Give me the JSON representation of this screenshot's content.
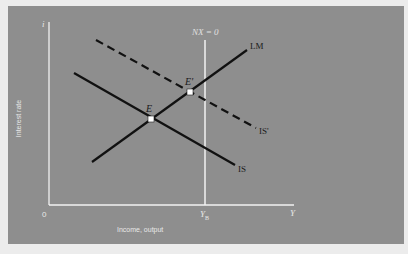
{
  "diagram": {
    "type": "IS-LM-BP economics diagram",
    "axes": {
      "y_axis_symbol": "i",
      "y_axis_label": "Interest rate",
      "x_axis_symbol": "Y",
      "x_axis_label": "Income, output",
      "origin_label": "0"
    },
    "curves": [
      {
        "name": "LM",
        "label": "LM",
        "style": "solid",
        "slope": "upward"
      },
      {
        "name": "IS",
        "label": "IS",
        "style": "solid",
        "slope": "downward"
      },
      {
        "name": "IS_prime",
        "label": "IS'",
        "style": "dashed",
        "slope": "downward"
      },
      {
        "name": "NX0",
        "label": "NX = 0",
        "style": "solid-white",
        "orientation": "vertical"
      }
    ],
    "points": [
      {
        "name": "E",
        "label": "E",
        "description": "intersection of IS and LM"
      },
      {
        "name": "E_prime",
        "label": "E'",
        "description": "intersection of IS' and LM"
      }
    ],
    "x_marks": {
      "y_b_label": "Y",
      "y_b_subscript": "B"
    },
    "colors": {
      "panel_background": "#8e8e8e",
      "page_background": "#ececec",
      "curve_color": "#111111",
      "axis_color": "#f2f2f2"
    }
  }
}
